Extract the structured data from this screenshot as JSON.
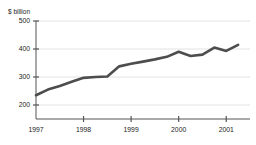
{
  "chart_data": {
    "type": "line",
    "title": "",
    "ylabel": "$ billion",
    "xlabel": "",
    "ylim": [
      150,
      500
    ],
    "yticks": [
      200,
      300,
      400,
      500
    ],
    "ytick_labels": [
      "200",
      "300",
      "400",
      "500"
    ],
    "xlim": [
      1997.0,
      2001.5
    ],
    "xticks": [
      1997,
      1998,
      1999,
      2000,
      2001
    ],
    "xtick_labels": [
      "1997",
      "1998",
      "1999",
      "2000",
      "2001"
    ],
    "grid": true,
    "legend": "none",
    "series": [
      {
        "name": "$ billion",
        "color": "#4d4d4d",
        "x": [
          1997.0,
          1997.25,
          1997.5,
          1997.75,
          1998.0,
          1998.25,
          1998.5,
          1998.75,
          1999.0,
          1999.25,
          1999.5,
          1999.75,
          2000.0,
          2000.25,
          2000.5,
          2000.75,
          2001.0,
          2001.25
        ],
        "values": [
          235,
          255,
          268,
          283,
          297,
          300,
          302,
          338,
          347,
          355,
          363,
          372,
          390,
          375,
          380,
          405,
          393,
          415
        ]
      }
    ]
  },
  "axis": {
    "unit_label": "$ billion"
  }
}
